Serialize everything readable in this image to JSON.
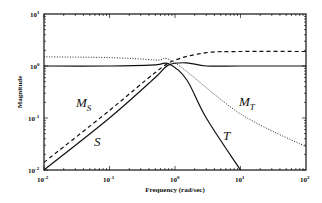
{
  "chart_data": {
    "type": "line",
    "title": "",
    "xlabel": "Frequency (rad/sec)",
    "ylabel": "Magnitude",
    "xscale": "log",
    "yscale": "log",
    "xlim": [
      0.01,
      100
    ],
    "ylim": [
      0.01,
      10
    ],
    "grid": false,
    "x_ticks": [
      "10^-2",
      "10^-1",
      "10^0",
      "10^1",
      "10^2"
    ],
    "y_ticks": [
      "10^-2",
      "10^-1",
      "10^0",
      "10^1"
    ],
    "series": [
      {
        "name": "S",
        "style": "solid",
        "x": [
          0.01,
          0.1,
          0.5,
          0.8,
          1.5,
          3,
          10,
          100
        ],
        "values": [
          0.01,
          0.1,
          0.6,
          1.05,
          1.15,
          1.0,
          1.0,
          1.0
        ]
      },
      {
        "name": "M_S",
        "style": "dashed",
        "x": [
          0.01,
          0.1,
          0.5,
          1,
          3,
          10,
          100
        ],
        "values": [
          0.014,
          0.14,
          0.75,
          1.3,
          1.8,
          1.9,
          1.9
        ]
      },
      {
        "name": "T",
        "style": "solid",
        "x": [
          0.01,
          0.1,
          0.5,
          0.8,
          1.5,
          3,
          10
        ],
        "values": [
          1.0,
          1.0,
          1.05,
          1.1,
          0.55,
          0.1,
          0.01
        ]
      },
      {
        "name": "M_T",
        "style": "dotted",
        "x": [
          0.01,
          0.1,
          0.5,
          1,
          10,
          100
        ],
        "values": [
          1.5,
          1.45,
          1.3,
          1.15,
          0.12,
          0.028
        ]
      }
    ],
    "annotations": [
      "M_S",
      "S",
      "T",
      "M_T"
    ]
  },
  "labels": {
    "xlabel": "Frequency (rad/sec)",
    "ylabel": "Magnitude",
    "ms_main": "M",
    "ms_sub": "S",
    "s": "S",
    "t": "T",
    "mt_main": "M",
    "mt_sub": "T"
  }
}
